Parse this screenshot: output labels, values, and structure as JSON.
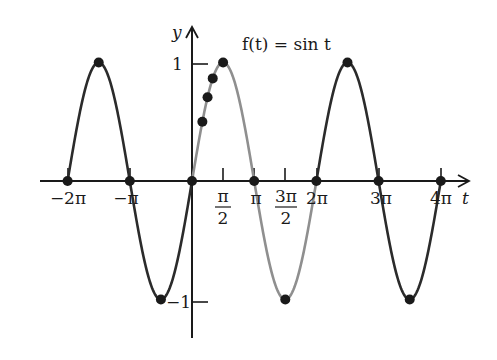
{
  "chart_data": {
    "type": "line",
    "title": "f(t) = sin t",
    "xlabel": "t",
    "ylabel": "y",
    "xlim": [
      -2.2,
      4.4
    ],
    "ylim": [
      -1.2,
      1.25
    ],
    "x_unit": "pi",
    "grid": false,
    "legend": null,
    "x_ticks": [
      {
        "value": -2,
        "label": "−2π"
      },
      {
        "value": -1,
        "label": "−π"
      },
      {
        "value": 0.5,
        "label": "π/2"
      },
      {
        "value": 1,
        "label": "π"
      },
      {
        "value": 1.5,
        "label": "3π/2"
      },
      {
        "value": 2,
        "label": "2π"
      },
      {
        "value": 3,
        "label": "3π"
      },
      {
        "value": 4,
        "label": "4π"
      }
    ],
    "y_ticks": [
      {
        "value": 1,
        "label": "1"
      },
      {
        "value": -1,
        "label": "−1"
      }
    ],
    "series": [
      {
        "name": "sin t (extended periods)",
        "color": "#2b2b2b",
        "x_range_pi": [
          -2,
          4
        ],
        "function": "sin"
      },
      {
        "name": "sin t (one period 0 to 2π, highlighted)",
        "color": "#8f8f8f",
        "x_range_pi": [
          0,
          2
        ],
        "function": "sin"
      }
    ],
    "marked_points": [
      {
        "t": "-2π",
        "y": 0
      },
      {
        "t": "-3π/2",
        "y": 1
      },
      {
        "t": "-π",
        "y": 0
      },
      {
        "t": "-π/2",
        "y": -1
      },
      {
        "t": "0",
        "y": 0
      },
      {
        "t": "π/6",
        "y": 0.5
      },
      {
        "t": "π/4",
        "y": 0.707
      },
      {
        "t": "π/3",
        "y": 0.866
      },
      {
        "t": "π/2",
        "y": 1
      },
      {
        "t": "π",
        "y": 0
      },
      {
        "t": "3π/2",
        "y": -1
      },
      {
        "t": "2π",
        "y": 0
      },
      {
        "t": "5π/2",
        "y": 1
      },
      {
        "t": "3π",
        "y": 0
      },
      {
        "t": "7π/2",
        "y": -1
      },
      {
        "t": "4π",
        "y": 0
      }
    ]
  },
  "labels": {
    "title": "f(t) = sin t",
    "y_axis": "y",
    "t_axis": "t",
    "y_one": "1",
    "y_neg_one": "−1",
    "x_neg_2pi": "−2π",
    "x_neg_pi": "−π",
    "x_pi_half_num": "π",
    "x_pi_half_den": "2",
    "x_pi": "π",
    "x_3pi_half_num": "3π",
    "x_3pi_half_den": "2",
    "x_2pi": "2π",
    "x_3pi": "3π",
    "x_4pi": "4π"
  }
}
